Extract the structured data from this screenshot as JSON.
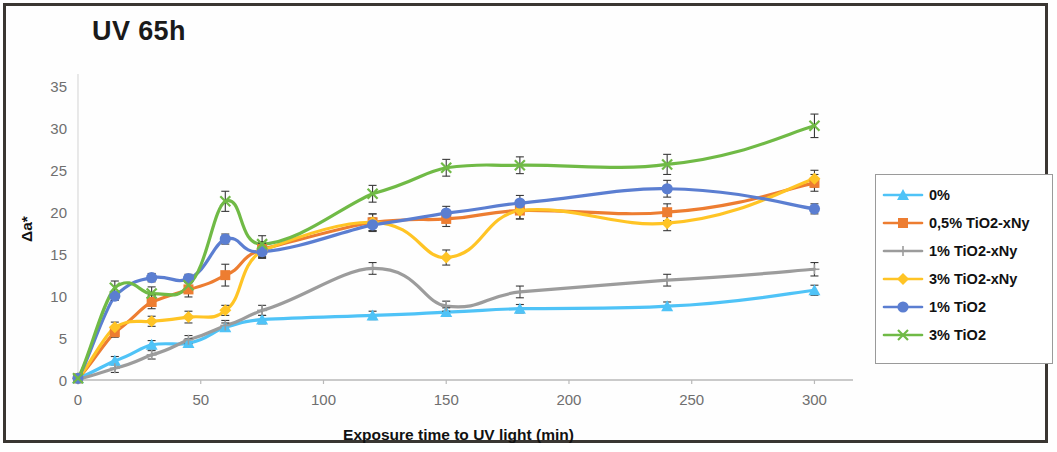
{
  "chart_data": {
    "type": "line",
    "title": "UV 65h",
    "xlabel": "Exposure time to UV light (min)",
    "ylabel": "Δa*",
    "xlim": [
      0,
      310
    ],
    "ylim": [
      0,
      36
    ],
    "xticks": [
      0,
      50,
      100,
      150,
      200,
      250,
      300
    ],
    "yticks": [
      0,
      5,
      10,
      15,
      20,
      25,
      30,
      35
    ],
    "grid": false,
    "legend_position": "right",
    "x": [
      0,
      15,
      30,
      45,
      60,
      75,
      120,
      150,
      180,
      240,
      300
    ],
    "series": [
      {
        "name": "0%",
        "color": "#4fc3f7",
        "marker": "triangle",
        "values": [
          0.2,
          2.3,
          4.2,
          4.4,
          6.3,
          7.2,
          7.7,
          8.1,
          8.5,
          8.8,
          10.7
        ],
        "errors": [
          0.3,
          0.5,
          0.5,
          0.5,
          0.5,
          0.5,
          0.5,
          0.5,
          0.5,
          0.5,
          0.6
        ]
      },
      {
        "name": "0,5% TiO2-xNy",
        "color": "#ed7d31",
        "marker": "square",
        "values": [
          0.2,
          5.7,
          9.3,
          10.8,
          12.5,
          15.6,
          18.8,
          19.2,
          20.2,
          20.0,
          23.5
        ],
        "errors": [
          0.3,
          0.6,
          0.8,
          0.9,
          1.3,
          0.9,
          1.0,
          0.9,
          1.0,
          1.0,
          1.0
        ]
      },
      {
        "name": "1% TiO2-xNy",
        "color": "#9c9c9c",
        "marker": "plus",
        "values": [
          0.1,
          1.4,
          3.0,
          4.8,
          6.5,
          8.3,
          13.3,
          8.8,
          10.5,
          11.9,
          13.2
        ],
        "errors": [
          0.3,
          0.5,
          0.5,
          0.5,
          0.6,
          0.6,
          0.7,
          0.6,
          0.7,
          0.7,
          0.8
        ]
      },
      {
        "name": "3% TiO2-xNy",
        "color": "#ffc425",
        "marker": "diamond",
        "values": [
          0.2,
          6.3,
          7.0,
          7.5,
          8.3,
          15.4,
          18.8,
          14.6,
          20.2,
          18.7,
          24.0
        ],
        "errors": [
          0.3,
          0.6,
          0.6,
          0.7,
          0.6,
          0.9,
          1.0,
          0.9,
          1.0,
          0.9,
          1.0
        ]
      },
      {
        "name": "1% TiO2",
        "color": "#5b7ed1",
        "marker": "circle",
        "values": [
          0.2,
          10.0,
          12.2,
          12.1,
          16.8,
          15.3,
          18.5,
          19.9,
          21.1,
          22.8,
          20.4
        ],
        "errors": [
          0.3,
          0.5,
          0.5,
          0.5,
          0.6,
          0.7,
          0.8,
          0.8,
          0.9,
          1.0,
          0.6
        ]
      },
      {
        "name": "3% TiO2",
        "color": "#70ba46",
        "marker": "cross",
        "values": [
          0.2,
          11.0,
          10.3,
          11.3,
          21.3,
          16.2,
          22.2,
          25.3,
          25.6,
          25.7,
          30.3
        ],
        "errors": [
          0.3,
          0.8,
          0.8,
          0.8,
          1.2,
          1.0,
          1.0,
          1.0,
          1.0,
          1.2,
          1.4
        ]
      }
    ]
  },
  "legend": {
    "items": [
      {
        "label": "0%"
      },
      {
        "label": "0,5% TiO2-xNy"
      },
      {
        "label": "1% TiO2-xNy"
      },
      {
        "label": "3% TiO2-xNy"
      },
      {
        "label": "1% TiO2"
      },
      {
        "label": "3% TiO2"
      }
    ]
  }
}
